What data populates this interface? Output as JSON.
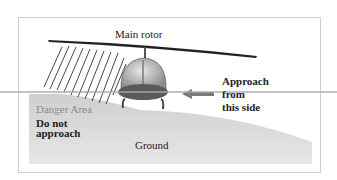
{
  "diagram": {
    "labels": {
      "main_rotor": "Main rotor",
      "approach_line1": "Approach",
      "approach_line2": "from",
      "approach_line3": "this side",
      "danger_area": "Danger Area",
      "do_not_line1": "Do not",
      "do_not_line2": "approach",
      "ground": "Ground"
    },
    "colors": {
      "ground": "#d9d9d9",
      "danger_text": "#8a8a8a",
      "arrow": "#7a7a7a",
      "body": "#5a5a5a"
    }
  }
}
